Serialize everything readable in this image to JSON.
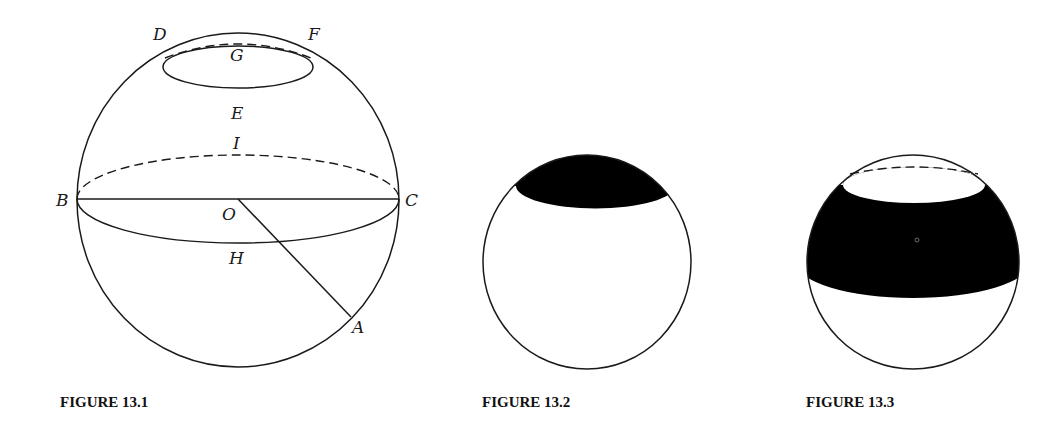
{
  "figures": [
    {
      "id": "13.1",
      "caption": "FIGURE 13.1",
      "description": "Sphere with center O, great circle through B and C, small circle DEF with G, radius OA",
      "labels": {
        "D": "D",
        "F": "F",
        "G": "G",
        "E": "E",
        "I": "I",
        "B": "B",
        "C": "C",
        "O": "O",
        "H": "H",
        "A": "A"
      }
    },
    {
      "id": "13.2",
      "caption": "FIGURE 13.2",
      "description": "Sphere with shaded spherical cap at top"
    },
    {
      "id": "13.3",
      "caption": "FIGURE 13.3",
      "description": "Sphere with shaded spherical zone (band) between two parallel planes"
    }
  ],
  "colors": {
    "line": "#1a1a1a",
    "fill_dark": "#000000",
    "background": "#ffffff"
  }
}
